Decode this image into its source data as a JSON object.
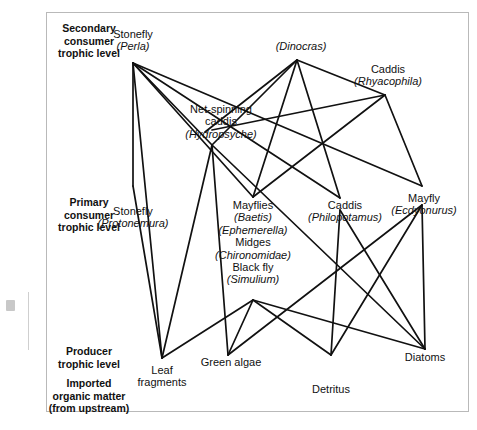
{
  "figure": {
    "background_color": "#ffffff",
    "link_color": "#111111",
    "frame_color": "#b9b9b9"
  },
  "trophic_levels": [
    {
      "id": "secondary",
      "lines": [
        "Secondary",
        "consumer",
        "trophic level"
      ]
    },
    {
      "id": "primary",
      "lines": [
        "Primary",
        "consumer",
        "trophic level"
      ]
    },
    {
      "id": "producer",
      "lines": [
        "Producer",
        "trophic level"
      ]
    },
    {
      "id": "imported",
      "lines": [
        "Imported",
        "organic matter",
        "(from upstream)"
      ]
    }
  ],
  "nodes": [
    {
      "id": "perla",
      "common": "Stonefly",
      "scientific": "(Perla)",
      "level": "secondary",
      "x": 133,
      "y": 63,
      "label_x": 133,
      "label_y": 28
    },
    {
      "id": "dinocras",
      "common": "",
      "scientific": "(Dinocras)",
      "level": "secondary",
      "x": 297,
      "y": 60,
      "label_x": 301,
      "label_y": 40
    },
    {
      "id": "rhyacophila",
      "common": "Caddis",
      "scientific": "(Rhyacophila)",
      "level": "secondary",
      "x": 385,
      "y": 95,
      "label_x": 388,
      "label_y": 65
    },
    {
      "id": "hydropsyche",
      "common": "Net-spinning caddis",
      "scientific": "(Hydropsyche)",
      "level": "secondary",
      "x": 212,
      "y": 145,
      "label_x": 221,
      "label_y": 103
    },
    {
      "id": "protonemura",
      "common": "Stonefly",
      "scientific": "(Protonemura)",
      "level": "primary",
      "x": 133,
      "y": 186,
      "label_x": 133,
      "label_y": 205
    },
    {
      "id": "mayflies",
      "common": "Mayflies Midges Black fly",
      "scientific": "(Baetis) (Ephemerella) (Chironomidae) (Simulium)",
      "level": "primary",
      "x": 253,
      "y": 197,
      "label_x": 253,
      "label_y": 200
    },
    {
      "id": "philopotamus",
      "common": "Caddis",
      "scientific": "(Philopotamus)",
      "level": "primary",
      "x": 340,
      "y": 198,
      "label_x": 345,
      "label_y": 200
    },
    {
      "id": "ecdyonurus",
      "common": "Mayfly",
      "scientific": "(Ecdyonurus)",
      "level": "primary",
      "x": 422,
      "y": 186,
      "label_x": 424,
      "label_y": 193
    },
    {
      "id": "leaf",
      "common": "Leaf fragments",
      "scientific": "",
      "level": "producer",
      "x": 162,
      "y": 358,
      "label_x": 162,
      "label_y": 365
    },
    {
      "id": "algae",
      "common": "Green algae",
      "scientific": "",
      "level": "producer",
      "x": 228,
      "y": 355,
      "label_x": 231,
      "label_y": 356
    },
    {
      "id": "detritus",
      "common": "Detritus",
      "scientific": "",
      "level": "producer",
      "x": 331,
      "y": 355,
      "label_x": 331,
      "label_y": 384
    },
    {
      "id": "diatoms",
      "common": "Diatoms",
      "scientific": "",
      "level": "producer",
      "x": 425,
      "y": 349,
      "label_x": 425,
      "label_y": 352
    }
  ],
  "node_labels": {
    "perla": {
      "line1": "Stonefly",
      "line2": "(Perla)"
    },
    "dinocras": {
      "line1": "(Dinocras)"
    },
    "rhyacophila": {
      "line1": "Caddis",
      "line2": "(Rhyacophila)"
    },
    "hydropsyche": {
      "line1": "Net-spinning",
      "line2": "caddis",
      "line3": "(Hydropsyche)"
    },
    "protonemura": {
      "line1": "Stonefly",
      "line2": "(Protonemura)"
    },
    "mayflies": {
      "line1": "Mayflies",
      "line2": "(Baetis)",
      "line3": "(Ephemerella)",
      "line4": "Midges",
      "line5": "(Chironomidae)",
      "line6": "Black fly",
      "line7": "(Simulium)"
    },
    "philopotamus": {
      "line1": "Caddis",
      "line2": "(Philopotamus)"
    },
    "ecdyonurus": {
      "line1": "Mayfly",
      "line2": "(Ecdyonurus)"
    },
    "leaf": {
      "line1": "Leaf",
      "line2": "fragments"
    },
    "algae": {
      "line1": "Green algae"
    },
    "detritus": {
      "line1": "Detritus"
    },
    "diatoms": {
      "line1": "Diatoms"
    }
  },
  "level_labels": {
    "secondary": {
      "line1": "Secondary",
      "line2": "consumer",
      "line3": "trophic level"
    },
    "primary": {
      "line1": "Primary",
      "line2": "consumer",
      "line3": "trophic level"
    },
    "producer": {
      "line1": "Producer",
      "line2": "trophic level"
    },
    "imported": {
      "line1": "Imported",
      "line2": "organic matter",
      "line3": "(from upstream)"
    }
  },
  "links": [
    {
      "from": "perla",
      "to": "protonemura"
    },
    {
      "from": "perla",
      "to": "hydropsyche"
    },
    {
      "from": "perla",
      "to": "mayflies"
    },
    {
      "from": "perla",
      "to": "philopotamus"
    },
    {
      "from": "perla",
      "to": "ecdyonurus"
    },
    {
      "from": "perla",
      "to": "leaf"
    },
    {
      "from": "dinocras",
      "to": "hydropsyche"
    },
    {
      "from": "dinocras",
      "to": "mayflies"
    },
    {
      "from": "dinocras",
      "to": "philopotamus"
    },
    {
      "from": "dinocras",
      "to": "rhyacophila"
    },
    {
      "from": "dinocras",
      "to": "protonemura"
    },
    {
      "from": "rhyacophila",
      "to": "hydropsyche"
    },
    {
      "from": "rhyacophila",
      "to": "mayflies"
    },
    {
      "from": "rhyacophila",
      "to": "ecdyonurus"
    },
    {
      "from": "hydropsyche",
      "to": "algae"
    },
    {
      "from": "hydropsyche",
      "to": "diatoms"
    },
    {
      "from": "hydropsyche",
      "to": "leaf"
    },
    {
      "from": "protonemura",
      "to": "leaf"
    },
    {
      "from": "mayflies",
      "to": "algae"
    },
    {
      "from": "mayflies",
      "to": "diatoms"
    },
    {
      "from": "mayflies",
      "to": "detritus"
    },
    {
      "from": "mayflies",
      "to": "leaf"
    },
    {
      "from": "philopotamus",
      "to": "detritus"
    },
    {
      "from": "philopotamus",
      "to": "diatoms"
    },
    {
      "from": "ecdyonurus",
      "to": "diatoms"
    },
    {
      "from": "ecdyonurus",
      "to": "detritus"
    },
    {
      "from": "ecdyonurus",
      "to": "algae"
    }
  ]
}
